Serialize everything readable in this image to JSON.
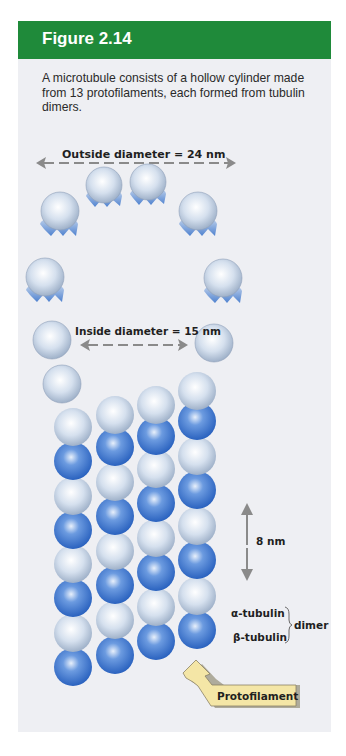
{
  "figure": {
    "title": "Figure 2.14",
    "caption": "A microtubule consists of a hollow cylinder made from 13 protofilaments, each formed from tubulin dimers."
  },
  "labels": {
    "outside_diameter": "Outside diameter = 24 nm",
    "inside_diameter": "Inside diameter = 15 nm",
    "spacing": "8 nm",
    "alpha": "α-tubulin",
    "beta": "β-tubulin",
    "dimer": "dimer",
    "protofilament": "Protofilament"
  },
  "colors": {
    "header_green": "#1f8a3a",
    "panel_bg": "#eeeff3",
    "alpha_tubulin": "#c9d6e8",
    "beta_tubulin": "#3d78d0",
    "callout_fill": "#f4e6a6",
    "arrow_gray": "#8a8a8a"
  },
  "diagram": {
    "ring_protofilament_count": 13,
    "lattice_columns": 4
  }
}
